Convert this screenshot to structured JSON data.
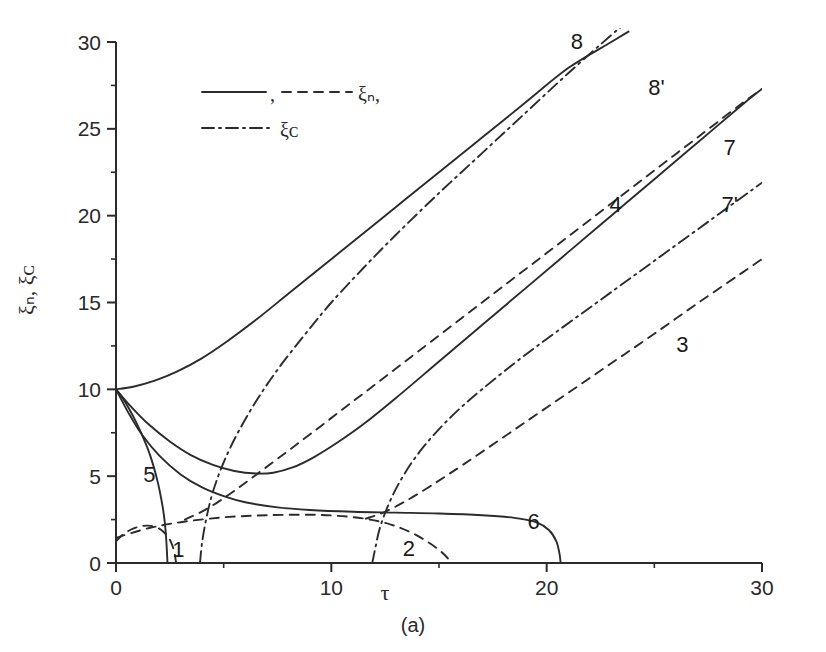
{
  "figure": {
    "caption": "(a)"
  },
  "chart_data": {
    "type": "line",
    "title": "",
    "xlabel": "τ",
    "ylabel": "ξₙ, ξᴄ",
    "xlim": [
      0,
      30
    ],
    "ylim": [
      0,
      30
    ],
    "grid": false,
    "x_ticks": [
      0,
      10,
      20,
      30
    ],
    "x_tick_labels": [
      "0",
      "10",
      "20",
      "30"
    ],
    "x_minor_ticks": [
      5,
      15,
      25
    ],
    "y_ticks": [
      0,
      5,
      10,
      15,
      20,
      25,
      30
    ],
    "y_tick_labels": [
      "0",
      "5",
      "10",
      "15",
      "20",
      "25",
      "30"
    ],
    "y_minor_ticks": [
      2.5,
      7.5,
      12.5,
      17.5,
      22.5,
      27.5
    ],
    "legend": {
      "position": "upper-left-inside",
      "entries": [
        {
          "id": "legend-solid",
          "style": "solid",
          "label": ""
        },
        {
          "id": "legend-dashed",
          "style": "dashed",
          "label": "ξₙ,"
        },
        {
          "id": "legend-dashdot",
          "style": "dashdot",
          "label": "ξᴄ"
        }
      ],
      "separator": ","
    },
    "series": [
      {
        "name": "1",
        "style": "dashed",
        "label": "1",
        "label_xy": [
          2.9,
          0.75
        ],
        "points": [
          [
            0,
            1.25
          ],
          [
            0.3,
            1.62
          ],
          [
            0.7,
            1.93
          ],
          [
            1.1,
            2.1
          ],
          [
            1.5,
            2.15
          ],
          [
            1.9,
            2.05
          ],
          [
            2.2,
            1.8
          ],
          [
            2.45,
            1.45
          ],
          [
            2.62,
            1.0
          ],
          [
            2.72,
            0.55
          ],
          [
            2.78,
            0.1
          ],
          [
            2.8,
            0
          ]
        ]
      },
      {
        "name": "2",
        "style": "dashed",
        "label": "2",
        "label_xy": [
          13.6,
          0.8
        ],
        "points": [
          [
            0,
            1.45
          ],
          [
            1.5,
            2.0
          ],
          [
            3.0,
            2.35
          ],
          [
            5.0,
            2.63
          ],
          [
            7.0,
            2.75
          ],
          [
            9.0,
            2.78
          ],
          [
            10.5,
            2.7
          ],
          [
            11.8,
            2.5
          ],
          [
            12.8,
            2.2
          ],
          [
            13.6,
            1.82
          ],
          [
            14.3,
            1.35
          ],
          [
            14.9,
            0.85
          ],
          [
            15.3,
            0.42
          ],
          [
            15.55,
            0.05
          ],
          [
            15.6,
            0
          ]
        ]
      },
      {
        "name": "3",
        "style": "dashed",
        "label": "3",
        "label_xy": [
          26.3,
          12.55
        ],
        "points": [
          [
            11.6,
            2.55
          ],
          [
            12.5,
            2.95
          ],
          [
            13.5,
            3.6
          ],
          [
            14.5,
            4.35
          ],
          [
            15.5,
            5.15
          ],
          [
            17,
            6.4
          ],
          [
            19,
            8.1
          ],
          [
            21,
            9.8
          ],
          [
            23,
            11.5
          ],
          [
            25,
            13.2
          ],
          [
            27,
            14.95
          ],
          [
            29,
            16.65
          ],
          [
            30,
            17.5
          ]
        ]
      },
      {
        "name": "4",
        "style": "dashed",
        "label": "4",
        "label_xy": [
          23.2,
          20.6
        ],
        "points": [
          [
            3.2,
            2.5
          ],
          [
            4.2,
            3.1
          ],
          [
            5.2,
            3.9
          ],
          [
            6.2,
            4.8
          ],
          [
            7.5,
            6.0
          ],
          [
            9,
            7.4
          ],
          [
            11,
            9.3
          ],
          [
            13,
            11.2
          ],
          [
            15,
            13.1
          ],
          [
            17,
            15.0
          ],
          [
            19,
            16.9
          ],
          [
            21,
            18.8
          ],
          [
            23,
            20.7
          ],
          [
            25,
            22.6
          ],
          [
            27,
            24.5
          ],
          [
            29,
            26.4
          ],
          [
            30,
            27.3
          ]
        ]
      },
      {
        "name": "5",
        "style": "solid",
        "label": "5",
        "label_xy": [
          1.55,
          5.05
        ],
        "points": [
          [
            0,
            10
          ],
          [
            0.3,
            9.5
          ],
          [
            0.6,
            8.9
          ],
          [
            0.9,
            8.2
          ],
          [
            1.2,
            7.4
          ],
          [
            1.5,
            6.5
          ],
          [
            1.75,
            5.55
          ],
          [
            1.95,
            4.6
          ],
          [
            2.1,
            3.7
          ],
          [
            2.22,
            2.8
          ],
          [
            2.3,
            1.9
          ],
          [
            2.35,
            1.0
          ],
          [
            2.38,
            0.3
          ],
          [
            2.39,
            0
          ]
        ]
      },
      {
        "name": "6",
        "style": "solid",
        "label": "6",
        "label_xy": [
          19.4,
          2.35
        ],
        "points": [
          [
            0,
            10
          ],
          [
            0.6,
            8.6
          ],
          [
            1.2,
            7.4
          ],
          [
            2,
            6.2
          ],
          [
            3,
            5.1
          ],
          [
            4,
            4.35
          ],
          [
            5,
            3.85
          ],
          [
            6,
            3.5
          ],
          [
            7.5,
            3.2
          ],
          [
            9,
            3.05
          ],
          [
            11,
            2.95
          ],
          [
            13,
            2.9
          ],
          [
            15,
            2.85
          ],
          [
            17,
            2.75
          ],
          [
            18.5,
            2.6
          ],
          [
            19.5,
            2.35
          ],
          [
            20.1,
            1.9
          ],
          [
            20.45,
            1.25
          ],
          [
            20.6,
            0.5
          ],
          [
            20.65,
            0
          ]
        ]
      },
      {
        "name": "7",
        "style": "solid",
        "label": "7",
        "label_xy": [
          28.5,
          23.9
        ],
        "points": [
          [
            0,
            10
          ],
          [
            0.7,
            9.0
          ],
          [
            1.5,
            8.0
          ],
          [
            2.5,
            7.0
          ],
          [
            3.5,
            6.2
          ],
          [
            4.5,
            5.65
          ],
          [
            5.5,
            5.3
          ],
          [
            6.5,
            5.15
          ],
          [
            7.3,
            5.2
          ],
          [
            8.2,
            5.5
          ],
          [
            9.2,
            6.1
          ],
          [
            10.3,
            6.95
          ],
          [
            11.5,
            8.0
          ],
          [
            13,
            9.5
          ],
          [
            15,
            11.6
          ],
          [
            17,
            13.7
          ],
          [
            19,
            15.8
          ],
          [
            21,
            17.9
          ],
          [
            23,
            20.0
          ],
          [
            25,
            22.1
          ],
          [
            27,
            24.2
          ],
          [
            29,
            26.3
          ],
          [
            30,
            27.3
          ]
        ]
      },
      {
        "name": "7'",
        "style": "dashdot",
        "label": "7'",
        "label_xy": [
          28.5,
          20.6
        ],
        "points": [
          [
            11.9,
            0
          ],
          [
            12.05,
            0.9
          ],
          [
            12.25,
            2.0
          ],
          [
            12.6,
            3.2
          ],
          [
            13.1,
            4.5
          ],
          [
            13.8,
            5.9
          ],
          [
            14.7,
            7.3
          ],
          [
            15.8,
            8.7
          ],
          [
            17,
            10.0
          ],
          [
            18.5,
            11.5
          ],
          [
            20,
            12.9
          ],
          [
            22,
            14.7
          ],
          [
            24,
            16.5
          ],
          [
            26,
            18.3
          ],
          [
            28,
            20.1
          ],
          [
            30,
            21.9
          ]
        ]
      },
      {
        "name": "8",
        "style": "solid",
        "label": "8",
        "label_xy": [
          21.4,
          30.0
        ],
        "points": [
          [
            0,
            10
          ],
          [
            0.8,
            10.15
          ],
          [
            1.8,
            10.5
          ],
          [
            2.8,
            11.0
          ],
          [
            4,
            11.8
          ],
          [
            5.2,
            12.8
          ],
          [
            6.5,
            14.0
          ],
          [
            8,
            15.5
          ],
          [
            9.5,
            17.0
          ],
          [
            11,
            18.5
          ],
          [
            13,
            20.5
          ],
          [
            15,
            22.5
          ],
          [
            17,
            24.5
          ],
          [
            19,
            26.5
          ],
          [
            21,
            28.5
          ],
          [
            23,
            30.0
          ],
          [
            23.8,
            30.6
          ]
        ]
      },
      {
        "name": "8'",
        "style": "dashdot",
        "label": "8'",
        "label_xy": [
          25.1,
          27.35
        ],
        "points": [
          [
            3.9,
            0
          ],
          [
            4.0,
            1.2
          ],
          [
            4.2,
            2.6
          ],
          [
            4.5,
            4.1
          ],
          [
            5.0,
            5.8
          ],
          [
            5.7,
            7.6
          ],
          [
            6.6,
            9.5
          ],
          [
            7.6,
            11.3
          ],
          [
            8.8,
            13.2
          ],
          [
            10,
            15.0
          ],
          [
            11.5,
            17.0
          ],
          [
            13,
            18.9
          ],
          [
            15,
            21.3
          ],
          [
            17,
            23.6
          ],
          [
            19,
            25.9
          ],
          [
            21,
            28.2
          ],
          [
            23,
            30.4
          ],
          [
            23.6,
            31.0
          ]
        ]
      }
    ]
  }
}
